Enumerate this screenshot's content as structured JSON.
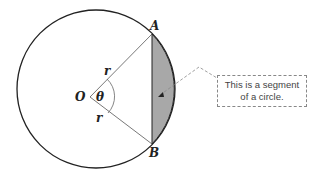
{
  "diagram": {
    "title": "Segment of a circle",
    "labels": {
      "center": "O",
      "point_a": "A",
      "point_b": "B",
      "radius_top": "r",
      "radius_bottom": "r",
      "angle": "θ"
    },
    "callout": {
      "line1": "This is a segment",
      "line2": "of a circle."
    },
    "colors": {
      "segment_fill": "#a8a8a8",
      "stroke": "#222222",
      "radius_line": "#555555"
    }
  }
}
